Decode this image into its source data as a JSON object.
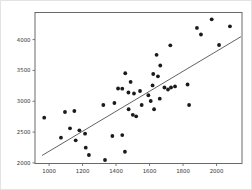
{
  "figure": {
    "background_color": "#ffffff",
    "spine_color": "#5a5a5a"
  },
  "chart_data": {
    "type": "scatter",
    "title": "",
    "xlabel": "",
    "ylabel": "",
    "grid": false,
    "legend": null,
    "xlim": [
      916,
      2152
    ],
    "ylim": [
      1990,
      4440
    ],
    "x_ticks": [
      1000,
      1200,
      1400,
      1600,
      1800,
      2000
    ],
    "y_ticks": [
      2000,
      2500,
      3000,
      3500,
      4000
    ],
    "point_color": "#1a1a1a",
    "point_radius": 1.9,
    "trend_line": {
      "x1": 958,
      "y1": 2120,
      "x2": 2146,
      "y2": 4048,
      "color": "#3a3a3a",
      "width": 0.8
    },
    "points": [
      [
        1971,
        4330
      ],
      [
        2080,
        4215
      ],
      [
        1883,
        4190
      ],
      [
        1907,
        4083
      ],
      [
        2015,
        3913
      ],
      [
        1724,
        3908
      ],
      [
        1642,
        3754
      ],
      [
        1664,
        3580
      ],
      [
        1622,
        3442
      ],
      [
        1650,
        3405
      ],
      [
        1455,
        3454
      ],
      [
        1487,
        3313
      ],
      [
        1412,
        3207
      ],
      [
        1437,
        3204
      ],
      [
        1474,
        3142
      ],
      [
        1507,
        3126
      ],
      [
        1543,
        3166
      ],
      [
        1618,
        3256
      ],
      [
        1689,
        3223
      ],
      [
        1710,
        3191
      ],
      [
        1728,
        3223
      ],
      [
        1752,
        3240
      ],
      [
        1827,
        3272
      ],
      [
        1324,
        2939
      ],
      [
        1390,
        2972
      ],
      [
        1475,
        2870
      ],
      [
        1500,
        2780
      ],
      [
        1520,
        2755
      ],
      [
        1553,
        2939
      ],
      [
        1593,
        3097
      ],
      [
        1607,
        3004
      ],
      [
        1627,
        2870
      ],
      [
        1661,
        3041
      ],
      [
        1836,
        2939
      ],
      [
        971,
        2733
      ],
      [
        1095,
        2826
      ],
      [
        1151,
        2842
      ],
      [
        1125,
        2561
      ],
      [
        1181,
        2529
      ],
      [
        1071,
        2409
      ],
      [
        1159,
        2366
      ],
      [
        1215,
        2474
      ],
      [
        1219,
        2246
      ],
      [
        1238,
        2128
      ],
      [
        1334,
        2047
      ],
      [
        1378,
        2436
      ],
      [
        1437,
        2452
      ],
      [
        1453,
        2181
      ]
    ]
  }
}
